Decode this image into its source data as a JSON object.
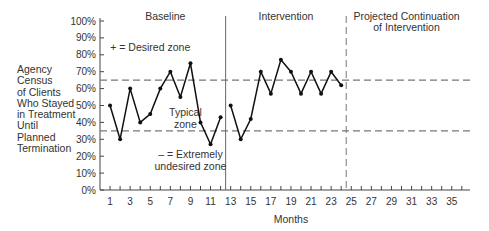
{
  "chart_data": {
    "type": "line",
    "title": "",
    "xlabel": "Months",
    "ylabel_lines": [
      "Agency",
      "Census",
      "of Clients",
      "Who Stayed",
      "in Treatment",
      "Until",
      "Planned",
      "Termination"
    ],
    "ylim": [
      0,
      100
    ],
    "xlim": [
      0,
      37
    ],
    "y_ticks": [
      "0%",
      "10%",
      "20%",
      "30%",
      "40%",
      "50%",
      "60%",
      "70%",
      "80%",
      "90%",
      "100%"
    ],
    "x_tick_labels": [
      1,
      3,
      5,
      7,
      9,
      11,
      13,
      15,
      17,
      19,
      21,
      23,
      25,
      27,
      29,
      31,
      33,
      35
    ],
    "x_minor_ticks": [
      1,
      2,
      3,
      4,
      5,
      6,
      7,
      8,
      9,
      10,
      11,
      12,
      13,
      14,
      15,
      16,
      17,
      18,
      19,
      20,
      21,
      22,
      23,
      24,
      25,
      26,
      27,
      28,
      29,
      30,
      31,
      32,
      33,
      34,
      35,
      36
    ],
    "series": [
      {
        "name": "Baseline",
        "x": [
          1,
          2,
          3,
          4,
          5,
          6,
          7,
          8,
          9,
          10,
          11,
          12
        ],
        "values": [
          50,
          30,
          60,
          40,
          45,
          60,
          70,
          55,
          75,
          40,
          27,
          43
        ]
      },
      {
        "name": "Intervention",
        "x": [
          13,
          14,
          15,
          16,
          17,
          18,
          19,
          20,
          21,
          22,
          23,
          24
        ],
        "values": [
          50,
          30,
          42,
          70,
          57,
          77,
          70,
          57,
          70,
          57,
          70,
          62
        ]
      }
    ],
    "thresholds": [
      {
        "name": "desired",
        "value": 65,
        "style": "dashed"
      },
      {
        "name": "undesired",
        "value": 35,
        "style": "dashed"
      }
    ],
    "phase_dividers": [
      {
        "x": 12.5,
        "style": "solid"
      },
      {
        "x": 24.5,
        "style": "dashed"
      }
    ],
    "phase_labels": [
      {
        "lines": [
          "Baseline"
        ],
        "x": 6.5
      },
      {
        "lines": [
          "Intervention"
        ],
        "x": 18.5
      },
      {
        "lines": [
          "Projected Continuation",
          "of Intervention"
        ],
        "x": 30.5
      }
    ],
    "annotations": [
      {
        "lines": [
          "+ = Desired zone"
        ],
        "x": 5,
        "y": 82
      },
      {
        "lines": [
          "Typical",
          "zone"
        ],
        "x": 8.5,
        "y": 44
      },
      {
        "lines": [
          "– = Extremely",
          "undesired zone"
        ],
        "x": 9,
        "y": 19
      }
    ],
    "grid": false,
    "legend": "none",
    "colors": {
      "line": "#111111",
      "axis": "#444444",
      "dash": "#777777",
      "text": "#333333"
    }
  }
}
